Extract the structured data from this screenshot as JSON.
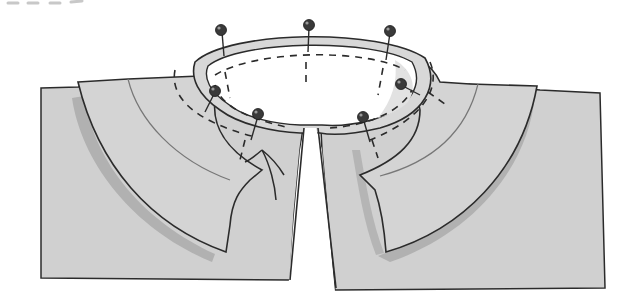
{
  "illustration": {
    "subject": "Collar pinned to garment neckline",
    "pin_count": 7,
    "colors": {
      "fabric": "#cfcfcf",
      "fabric_light": "#dcdcdc",
      "shadow": "#a9a9a9",
      "outline": "#2b2b2b",
      "pin_head": "#3a3a3a",
      "background": "#ffffff",
      "top_dash": "#c8c8c8"
    }
  }
}
